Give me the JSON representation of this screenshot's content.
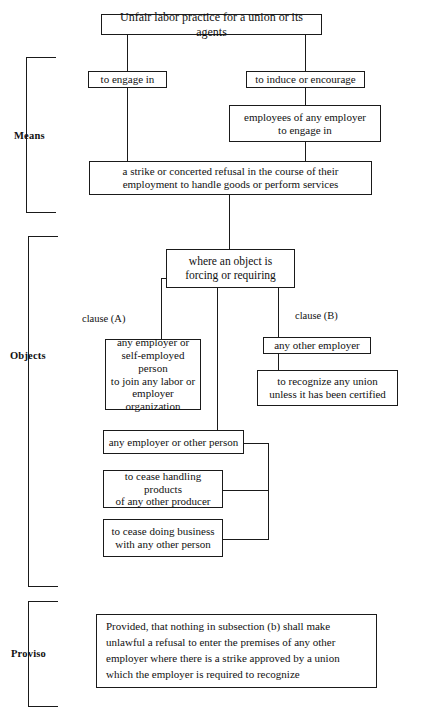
{
  "page": {
    "top_fragment": "",
    "width": 423,
    "height": 719,
    "ink_color": "#1a1a1a",
    "background": "#ffffff"
  },
  "brackets": [
    {
      "id": "means",
      "label": "Means"
    },
    {
      "id": "objects",
      "label": "Objects"
    },
    {
      "id": "proviso",
      "label": "Proviso"
    }
  ],
  "clause_labels": [
    {
      "id": "clause-a",
      "label": "clause (A)"
    },
    {
      "id": "clause-b",
      "label": "clause (B)"
    }
  ],
  "boxes": {
    "root": {
      "text": "Unfair labor practice for a union or its agents"
    },
    "engage": {
      "text": "to engage in"
    },
    "induce": {
      "text": "to induce or encourage"
    },
    "employees": {
      "line1": "employees of any employer",
      "line2": "to engage in"
    },
    "strike": {
      "line1": "a strike or concerted refusal in the course of their",
      "line2": "employment to handle goods or perform services"
    },
    "object": {
      "line1": "where an object is",
      "line2": "forcing or requiring"
    },
    "clause_a_target": {
      "line1": "any employer or",
      "line2": "self-employed person",
      "line3": "to join any labor or",
      "line4": "employer organization"
    },
    "clause_b_target": {
      "text": "any other employer"
    },
    "recognize": {
      "line1": "to recognize any union",
      "line2": "unless it has been certified"
    },
    "any_employer": {
      "text": "any employer or other person"
    },
    "cease_handling": {
      "line1": "to cease handling products",
      "line2": "of any other producer"
    },
    "cease_business": {
      "line1": "to cease doing business",
      "line2": "with any other person"
    },
    "proviso": {
      "line1": "Provided, that nothing in subsection (b) shall make",
      "line2": "unlawful a refusal to enter the premises of any other",
      "line3": "employer where there is a strike approved by a union",
      "line4": "which the employer is required to recognize"
    }
  }
}
